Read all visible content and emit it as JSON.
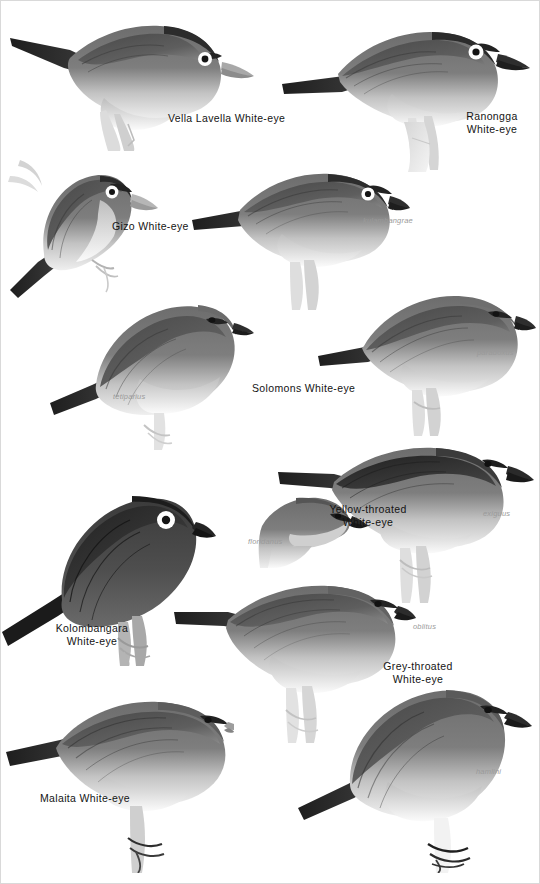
{
  "plate": {
    "title": "Solomon Islands White-eyes plate",
    "background_color": "#ffffff",
    "label_color": "#141414",
    "sublabel_color": "#9a9a9a"
  },
  "species_labels": [
    {
      "id": "vella-lavella-white-eye",
      "text": "Vella Lavella White-eye",
      "x": 168,
      "y": 115,
      "align": "left"
    },
    {
      "id": "ranongga-white-eye",
      "text": "Ranongga\nWhite-eye",
      "x": 449,
      "y": 113,
      "align": "center"
    },
    {
      "id": "gizo-white-eye",
      "text": "Gizo White-eye",
      "x": 112,
      "y": 223,
      "align": "left"
    },
    {
      "id": "solomons-white-eye",
      "text": "Solomons White-eye",
      "x": 254,
      "y": 385,
      "align": "left"
    },
    {
      "id": "yellow-throated-white-eye",
      "text": "Yellow-throated\nWhite-eye",
      "x": 366,
      "y": 530,
      "align": "center"
    },
    {
      "id": "kolombangara-white-eye",
      "text": "Kolombangara\nWhite-eye",
      "x": 91,
      "y": 627,
      "align": "center"
    },
    {
      "id": "grey-throated-white-eye",
      "text": "Grey-throated\nWhite-eye",
      "x": 416,
      "y": 665,
      "align": "center"
    },
    {
      "id": "malaita-white-eye",
      "text": "Malaita White-eye",
      "x": 40,
      "y": 795,
      "align": "left"
    }
  ],
  "subspecies_labels": [
    {
      "id": "kulambangrae",
      "text": "kulambangrae",
      "x": 363,
      "y": 220
    },
    {
      "id": "tetiparius",
      "text": "tetiparius",
      "x": 117,
      "y": 396
    },
    {
      "id": "paradoxus",
      "text": "paradoxus",
      "x": 479,
      "y": 352
    },
    {
      "id": "exiguus",
      "text": "exiguus",
      "x": 483,
      "y": 512
    },
    {
      "id": "floridanus",
      "text": "floridanus",
      "x": 250,
      "y": 541
    },
    {
      "id": "oblitus",
      "text": "oblitus",
      "x": 415,
      "y": 625
    },
    {
      "id": "hamlini",
      "text": "hamlini",
      "x": 477,
      "y": 770
    }
  ],
  "birds": [
    {
      "id": "bird-vella-lavella",
      "species": "Vella Lavella White-eye",
      "pose": "perched-facing-right-long-tail-left",
      "eye_ring": "white",
      "crown": "dark",
      "underparts": "pale",
      "x": 8,
      "y": 8,
      "w": 256,
      "h": 140
    },
    {
      "id": "bird-ranongga",
      "species": "Ranongga White-eye",
      "pose": "perched-facing-right-on-branch",
      "eye_ring": "white",
      "crown": "dark",
      "underparts": "pale",
      "x": 282,
      "y": 14,
      "w": 250,
      "h": 150
    },
    {
      "id": "bird-gizo",
      "species": "Gizo White-eye",
      "pose": "clinging-to-stem-facing-right",
      "eye_ring": "white",
      "crown": "dark",
      "underparts": "pale",
      "x": 8,
      "y": 152,
      "w": 150,
      "h": 150
    },
    {
      "id": "bird-solomons-kulambangrae",
      "species": "Solomons White-eye",
      "subspecies": "kulambangrae",
      "pose": "perched-facing-right-on-stump",
      "eye_ring": "white",
      "crown": "dark",
      "underparts": "pale",
      "x": 196,
      "y": 160,
      "w": 210,
      "h": 145
    },
    {
      "id": "bird-solomons-tetiparius",
      "species": "Solomons White-eye",
      "subspecies": "tetiparius",
      "pose": "perched-facing-right-on-twig",
      "eye_ring": "none",
      "crown": "plain-grey",
      "underparts": "pale",
      "x": 54,
      "y": 288,
      "w": 200,
      "h": 160
    },
    {
      "id": "bird-solomons-paradoxus",
      "species": "Solomons White-eye",
      "subspecies": "paradoxus",
      "pose": "perched-facing-right-on-stump",
      "eye_ring": "none",
      "crown": "plain-grey",
      "underparts": "pale",
      "x": 320,
      "y": 286,
      "w": 212,
      "h": 148
    },
    {
      "id": "bird-yellow-throated-exiguus",
      "species": "Yellow-throated White-eye",
      "subspecies": "exiguus",
      "pose": "perched-facing-right-on-twig",
      "eye_ring": "none",
      "crown": "dark-grey",
      "underparts": "pale",
      "x": 278,
      "y": 440,
      "w": 256,
      "h": 160
    },
    {
      "id": "bird-yellow-throated-floridanus",
      "species": "Yellow-throated White-eye",
      "subspecies": "floridanus",
      "pose": "head-and-breast-only-facing-right",
      "eye_ring": "none",
      "crown": "grey",
      "underparts": "pale",
      "x": 258,
      "y": 492,
      "w": 108,
      "h": 78
    },
    {
      "id": "bird-kolombangara",
      "species": "Kolombangara White-eye",
      "pose": "perched-facing-right-on-branch",
      "eye_ring": "white-bold",
      "crown": "blackish",
      "underparts": "dark",
      "x": 4,
      "y": 468,
      "w": 210,
      "h": 196
    },
    {
      "id": "bird-grey-throated-oblitus",
      "species": "Grey-throated White-eye",
      "subspecies": "oblitus",
      "pose": "perched-facing-right-on-branch",
      "eye_ring": "none",
      "crown": "grey",
      "underparts": "pale",
      "x": 176,
      "y": 580,
      "w": 236,
      "h": 160
    },
    {
      "id": "bird-malaita",
      "species": "Malaita White-eye",
      "pose": "perched-facing-right-on-branch",
      "eye_ring": "none",
      "crown": "grey",
      "underparts": "pale",
      "x": 8,
      "y": 690,
      "w": 220,
      "h": 180
    },
    {
      "id": "bird-grey-throated-hamlini",
      "species": "Grey-throated White-eye",
      "subspecies": "hamlini",
      "pose": "perched-facing-right-on-branch",
      "eye_ring": "none",
      "crown": "grey",
      "underparts": "pale",
      "x": 300,
      "y": 670,
      "w": 230,
      "h": 200
    }
  ]
}
